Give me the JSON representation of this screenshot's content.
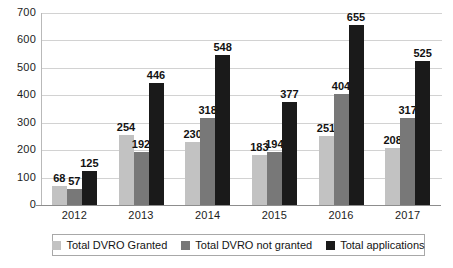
{
  "chart_data": {
    "type": "bar",
    "title": "",
    "subtitle": "",
    "xlabel": "",
    "ylabel": "",
    "categories": [
      "2012",
      "2013",
      "2014",
      "2015",
      "2016",
      "2017"
    ],
    "series": [
      {
        "name": "Total DVRO Granted",
        "color": "#c2c2c2",
        "values": [
          68,
          254,
          230,
          183,
          251,
          208
        ]
      },
      {
        "name": "Total DVRO not granted",
        "color": "#787878",
        "values": [
          57,
          192,
          318,
          194,
          404,
          317
        ]
      },
      {
        "name": "Total applications",
        "color": "#1a1a1a",
        "values": [
          125,
          446,
          548,
          377,
          655,
          525
        ]
      }
    ],
    "ylim": [
      0,
      700
    ],
    "yticks": [
      0,
      100,
      200,
      300,
      400,
      500,
      600,
      700
    ],
    "ytick_labels": [
      "0",
      "100",
      "200",
      "300",
      "400",
      "500",
      "600",
      "700"
    ],
    "grid": true,
    "data_labels": true,
    "legend_position": "bottom",
    "orientation": "vertical",
    "bar_mode": "grouped"
  },
  "legend": {
    "items": [
      {
        "label": "Total DVRO Granted",
        "color": "#c2c2c2"
      },
      {
        "label": "Total DVRO not granted",
        "color": "#787878"
      },
      {
        "label": "Total applications",
        "color": "#1a1a1a"
      }
    ]
  },
  "colors": {
    "gridline": "#d2d2d2",
    "axis": "#8d8d8d",
    "background": "#ffffff",
    "text": "#1a1a1a"
  }
}
